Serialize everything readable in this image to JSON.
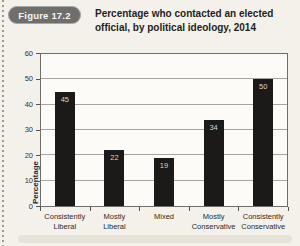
{
  "figure": {
    "badge": "Figure 17.2",
    "title": "Percentage who contacted an elected official, by political ideology, 2014"
  },
  "chart_data": {
    "type": "bar",
    "categories": [
      "Consistently Liberal",
      "Mostly Liberal",
      "Mixed",
      "Mostly Conservative",
      "Consistently Conservative"
    ],
    "values": [
      45,
      22,
      19,
      34,
      50
    ],
    "title": "Percentage who contacted an elected official, by political ideology, 2014",
    "xlabel": "",
    "ylabel": "Percentage",
    "ylim": [
      0,
      60
    ],
    "ytick_step": 10,
    "grid": true,
    "legend": false,
    "bar_color": "#1b1a19",
    "value_label_color": "#d8d6d2"
  }
}
